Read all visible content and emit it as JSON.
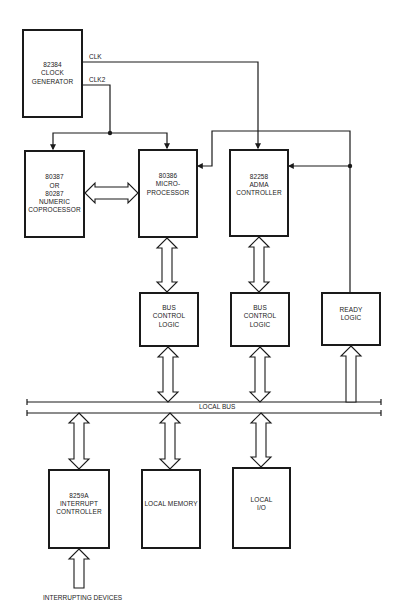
{
  "blocks": {
    "clock_generator": "82384\nCLOCK\nGENERATOR",
    "coprocessor": "80387\nOR\n80287\nNUMERIC\nCOPROCESSOR",
    "microprocessor": "80386\nMICRO-\nPROCESSOR",
    "adma_controller": "82258\nADMA\nCONTROLLER",
    "bus_control_1": "BUS\nCONTROL\nLOGIC",
    "bus_control_2": "BUS\nCONTROL\nLOGIC",
    "ready_logic": "READY\nLOGIC",
    "interrupt_controller": "8259A\nINTERRUPT\nCONTROLLER",
    "local_memory": "LOCAL MEMORY",
    "local_io": "LOCAL\nI/O"
  },
  "signals": {
    "clk": "CLK",
    "clk2": "CLK2",
    "local_bus": "LOCAL BUS",
    "interrupting_devices": "INTERRUPTING DEVICES"
  },
  "colors": {
    "line": "#1a1a1a",
    "background": "#ffffff"
  }
}
